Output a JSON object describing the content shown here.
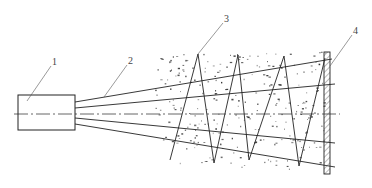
{
  "diagram": {
    "title": "",
    "colors": {
      "line": "#222222",
      "label": "#444444",
      "centerline": "#555555",
      "speckle": "#333333",
      "background": "#ffffff"
    },
    "labels": [
      {
        "id": "1",
        "text": "1",
        "refers_to": "source-box"
      },
      {
        "id": "2",
        "text": "2",
        "refers_to": "beam-fan"
      },
      {
        "id": "3",
        "text": "3",
        "refers_to": "zigzag-path"
      },
      {
        "id": "4",
        "text": "4",
        "refers_to": "target-plate"
      }
    ],
    "components": {
      "source_box": {
        "x": 18,
        "y": 95,
        "w": 57,
        "h": 35
      },
      "centerline_y": 114,
      "target_plate": {
        "x": 324,
        "y": 52,
        "w": 6,
        "h": 122
      },
      "beam_count": 4
    }
  }
}
